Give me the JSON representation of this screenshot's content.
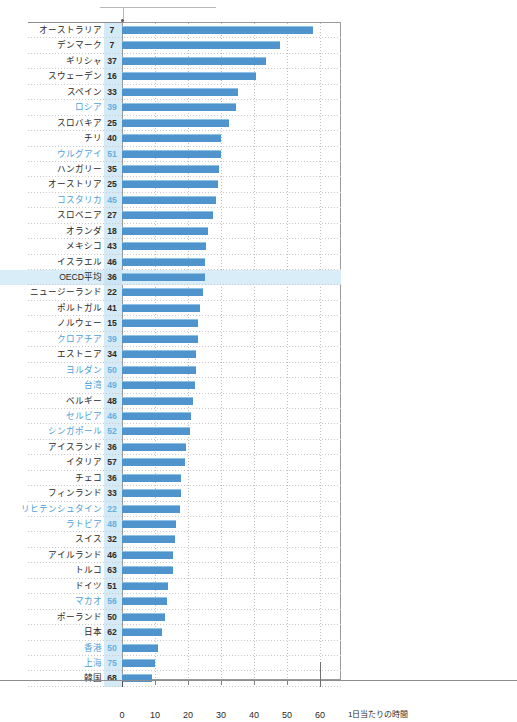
{
  "top_note": {
    "faint_title": "",
    "leader": "annotation-leader-line"
  },
  "axis": {
    "x_title": "1日当たりの時間",
    "ticks": [
      0,
      10,
      20,
      30,
      40,
      50,
      60
    ],
    "xlim": [
      0,
      66
    ]
  },
  "chart_data": {
    "type": "bar",
    "orientation": "horizontal",
    "title": "",
    "xlabel": "1日当たりの時間",
    "ylabel": "",
    "xlim": [
      0,
      66
    ],
    "xticks": [
      0,
      10,
      20,
      30,
      40,
      50,
      60
    ],
    "grid": "vertical-dotted",
    "legend": "none",
    "value_column_header": "",
    "note": "左列の数値は別指標。棒の長さは1日当たりの時間。",
    "categories": [
      "オーストラリア",
      "デンマーク",
      "ギリシャ",
      "スウェーデン",
      "スペイン",
      "ロシア",
      "スロバキア",
      "チリ",
      "ウルグアイ",
      "ハンガリー",
      "オーストリア",
      "コスタリカ",
      "スロベニア",
      "オランダ",
      "メキシコ",
      "イスラエル",
      "OECD平均",
      "ニュージーランド",
      "ポルトガル",
      "ノルウェー",
      "クロアチア",
      "エストニア",
      "ヨルダン",
      "台湾",
      "ベルギー",
      "セルビア",
      "シンガポール",
      "アイスランド",
      "イタリア",
      "チェコ",
      "フィンランド",
      "リヒテンシュタイン",
      "ラトビア",
      "スイス",
      "アイルランド",
      "トルコ",
      "ドイツ",
      "マカオ",
      "ポーランド",
      "日本",
      "香港",
      "上海",
      "韓国"
    ],
    "values": [
      58.0,
      48.0,
      43.5,
      40.5,
      35.0,
      34.5,
      32.5,
      30.0,
      30.0,
      29.5,
      29.0,
      28.5,
      27.5,
      26.0,
      25.5,
      25.0,
      25.0,
      24.5,
      23.5,
      23.0,
      23.0,
      22.5,
      22.5,
      22.0,
      21.5,
      21.0,
      20.5,
      19.5,
      19.0,
      18.0,
      18.0,
      17.5,
      16.5,
      16.0,
      15.5,
      15.5,
      14.0,
      13.5,
      13.0,
      12.0,
      11.0,
      10.0,
      9.0
    ],
    "secondary_values": [
      7,
      7,
      37,
      16,
      33,
      39,
      25,
      40,
      51,
      35,
      25,
      45,
      27,
      18,
      43,
      46,
      36,
      22,
      41,
      15,
      39,
      34,
      50,
      49,
      48,
      46,
      52,
      36,
      57,
      36,
      33,
      22,
      48,
      32,
      46,
      63,
      51,
      56,
      50,
      62,
      50,
      75,
      68
    ],
    "non_oecd_flags": [
      false,
      false,
      false,
      false,
      false,
      true,
      false,
      false,
      true,
      false,
      false,
      true,
      false,
      false,
      false,
      false,
      false,
      false,
      false,
      false,
      true,
      false,
      true,
      true,
      false,
      true,
      true,
      false,
      false,
      false,
      false,
      true,
      true,
      false,
      false,
      false,
      false,
      true,
      false,
      false,
      true,
      true,
      false
    ],
    "highlight_row": "OECD平均",
    "bar_color": "#4f94cd",
    "highlight_color": "#d8edf8",
    "value_column_color": "#d5eaf7",
    "nonoecd_text_color": "#4ea0d8"
  }
}
